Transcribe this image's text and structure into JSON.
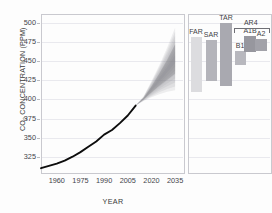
{
  "chart_data": {
    "type": "line",
    "title": "",
    "xlabel": "YEAR",
    "ylabel_prefix": "CO",
    "ylabel_sub": "2",
    "ylabel_suffix": " CONCENTRATION (PPM)",
    "ylabel_full": "CO2 CONCENTRATION (PPM)",
    "xlim": [
      1950,
      2040
    ],
    "ylim": [
      305,
      512
    ],
    "yticks": [
      325,
      350,
      375,
      400,
      425,
      450,
      475,
      500
    ],
    "xticks": [
      1960,
      1975,
      1990,
      2005,
      2020,
      2035
    ],
    "grid": true,
    "legend": "none",
    "series": [
      {
        "name": "Observed CO2 concentration",
        "type": "line",
        "color": "#0d0d0d",
        "x": [
          1950,
          1955,
          1960,
          1965,
          1970,
          1975,
          1980,
          1985,
          1990,
          1995,
          2000,
          2005,
          2010
        ],
        "values": [
          310,
          313,
          316,
          320,
          325,
          331,
          338,
          345,
          354,
          360,
          369,
          379,
          392
        ]
      },
      {
        "name": "Projection uncertainty fan",
        "type": "area",
        "color": "#8e8e94",
        "x": [
          2010,
          2015,
          2020,
          2025,
          2030,
          2035
        ],
        "upper": [
          392,
          404,
          424,
          445,
          468,
          494
        ],
        "lower": [
          392,
          398,
          403,
          407,
          410,
          412
        ],
        "mid_upper": [
          392,
          402,
          417,
          434,
          452,
          472
        ],
        "mid_lower": [
          392,
          400,
          409,
          418,
          426,
          434
        ]
      }
    ],
    "assessment_panel": {
      "axis_shared_with_main": true,
      "bracket_label": "AR4",
      "bars": [
        {
          "label": "FAR",
          "low": 410,
          "high": 482,
          "color": "#dcdcdf",
          "group": null
        },
        {
          "label": "SAR",
          "low": 424,
          "high": 478,
          "color": "#b4b4ba",
          "group": null
        },
        {
          "label": "TAR",
          "low": 418,
          "high": 500,
          "color": "#a9a9b0",
          "group": null
        },
        {
          "label": "B1",
          "low": 445,
          "high": 463,
          "color": "#b8b8be",
          "group": "AR4"
        },
        {
          "label": "A1B",
          "low": 462,
          "high": 483,
          "color": "#97979e",
          "group": "AR4"
        },
        {
          "label": "A2",
          "low": 464,
          "high": 479,
          "color": "#a2a2a9",
          "group": "AR4"
        }
      ]
    }
  }
}
